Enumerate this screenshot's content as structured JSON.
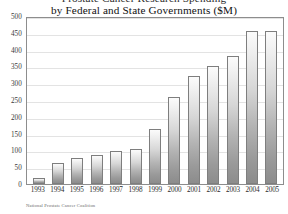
{
  "chart_data": {
    "type": "bar",
    "title": "Prostate Cancer Research Spending",
    "title_line_1": "Prostate Cancer Research Spending",
    "title_line_2": "by Federal and State Governments ($M)",
    "categories": [
      "1993",
      "1994",
      "1995",
      "1996",
      "1997",
      "1998",
      "1999",
      "2000",
      "2001",
      "2002",
      "2003",
      "2004",
      "2005"
    ],
    "values": [
      17,
      63,
      78,
      85,
      97,
      105,
      165,
      260,
      320,
      350,
      380,
      455,
      455
    ],
    "series": [
      {
        "name": "Federal and State Government Spending ($M)",
        "values": [
          17,
          63,
          78,
          85,
          97,
          105,
          165,
          260,
          320,
          350,
          380,
          455,
          455
        ]
      }
    ],
    "xlabel": "",
    "ylabel": "",
    "ylim": [
      0,
      500
    ],
    "ytick_step": 50,
    "yticks": [
      "500",
      "450",
      "400",
      "350",
      "300",
      "250",
      "200",
      "150",
      "100",
      "50",
      "0"
    ],
    "grid": true,
    "legend": "none",
    "source": "National Prostate Cancer Coalition",
    "bar_color_top": "#fbfbfb",
    "bar_color_bottom": "#8c8c8c",
    "bar_border_color": "#7e7e7e",
    "gridline_color": "#e3e3e3",
    "frame_color": "#8d8d8d",
    "background_color": "#ffffff",
    "text_color": "#1a1a1a"
  }
}
